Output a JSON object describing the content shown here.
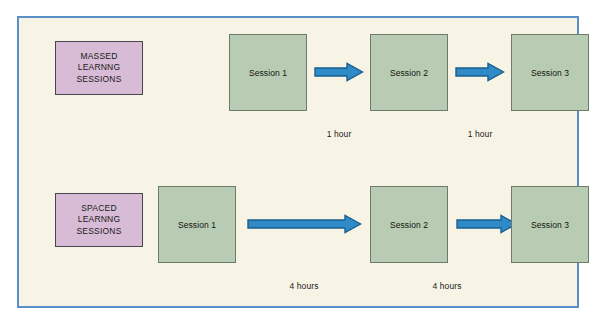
{
  "colors": {
    "frame_border": "#5b8fc9",
    "canvas_background": "#f7f4e6",
    "category_box_fill": "#d8bcd6",
    "category_box_border": "#4a4450",
    "session_box_fill": "#b8ccb3",
    "session_box_border": "#6e7a6c",
    "arrow_fill": "#2e8bc8",
    "arrow_stroke": "#1b5f8e",
    "text": "#1a1a1a"
  },
  "rows": [
    {
      "id": "massed",
      "category_label_lines": [
        "MASSED",
        "LEARNNG",
        "SESSIONS"
      ],
      "sessions": [
        {
          "label": "Session 1"
        },
        {
          "label": "Session 2"
        },
        {
          "label": "Session 3"
        }
      ],
      "intervals": [
        {
          "label": "1 hour"
        },
        {
          "label": "1 hour"
        }
      ]
    },
    {
      "id": "spaced",
      "category_label_lines": [
        "SPACED",
        "LEARNNG",
        "SESSIONS"
      ],
      "sessions": [
        {
          "label": "Session 1"
        },
        {
          "label": "Session 2"
        },
        {
          "label": "Session 3"
        }
      ],
      "intervals": [
        {
          "label": "4 hours"
        },
        {
          "label": "4 hours"
        }
      ]
    }
  ]
}
